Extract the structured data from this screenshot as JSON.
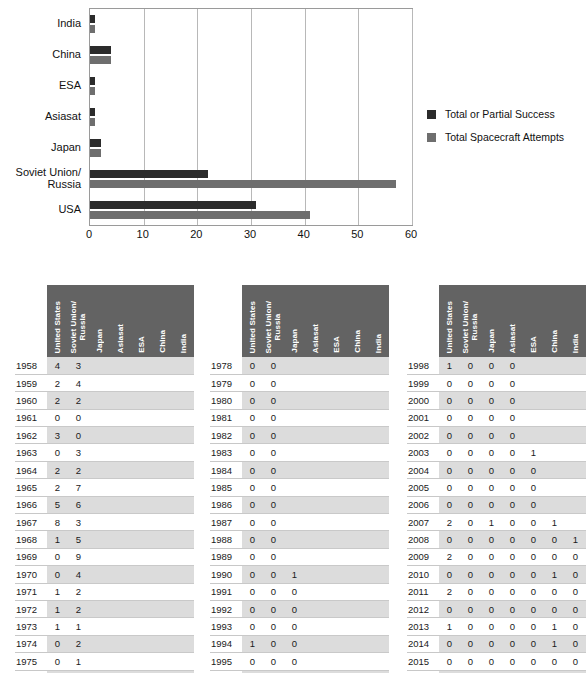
{
  "chart_data": {
    "type": "bar",
    "orientation": "horizontal",
    "title": "",
    "xlabel": "",
    "ylabel": "",
    "xlim": [
      0,
      60
    ],
    "xticks": [
      0,
      10,
      20,
      30,
      40,
      50,
      60
    ],
    "grid": true,
    "legend_position": "right",
    "categories": [
      "India",
      "China",
      "ESA",
      "Asiasat",
      "Japan",
      "Soviet Union/\nRussia",
      "USA"
    ],
    "series": [
      {
        "name": "Total or Partial Success",
        "color": "#2b2b2b",
        "values": [
          1,
          4,
          1,
          1,
          2,
          22,
          31
        ]
      },
      {
        "name": "Total Spacecraft Attempts",
        "color": "#6e6e6e",
        "values": [
          1,
          4,
          1,
          1,
          2,
          57,
          41
        ]
      }
    ]
  },
  "chart": {
    "categories": [
      {
        "label_line1": "India",
        "label_line2": ""
      },
      {
        "label_line1": "China",
        "label_line2": ""
      },
      {
        "label_line1": "ESA",
        "label_line2": ""
      },
      {
        "label_line1": "Asiasat",
        "label_line2": ""
      },
      {
        "label_line1": "Japan",
        "label_line2": ""
      },
      {
        "label_line1": "Soviet Union/",
        "label_line2": "Russia"
      },
      {
        "label_line1": "USA",
        "label_line2": ""
      }
    ],
    "xticks": [
      "0",
      "10",
      "20",
      "30",
      "40",
      "50",
      "60"
    ],
    "legend": [
      {
        "label": "Total or Partial Success",
        "color": "#2b2b2b"
      },
      {
        "label": "Total Spacecraft Attempts",
        "color": "#6e6e6e"
      }
    ]
  },
  "tables": {
    "columns": [
      "United States",
      "Soviet Union/ Russia",
      "Japan",
      "Asiasat",
      "ESA",
      "China",
      "India"
    ],
    "columns_split": [
      [
        "United States"
      ],
      [
        "Soviet Union/",
        "Russia"
      ],
      [
        "Japan"
      ],
      [
        "Asiasat"
      ],
      [
        "ESA"
      ],
      [
        "China"
      ],
      [
        "India"
      ]
    ],
    "blocks": [
      {
        "rows": [
          {
            "year": "1958",
            "values": [
              "4",
              "3",
              "",
              "",
              "",
              "",
              ""
            ]
          },
          {
            "year": "1959",
            "values": [
              "2",
              "4",
              "",
              "",
              "",
              "",
              ""
            ]
          },
          {
            "year": "1960",
            "values": [
              "2",
              "2",
              "",
              "",
              "",
              "",
              ""
            ]
          },
          {
            "year": "1961",
            "values": [
              "0",
              "0",
              "",
              "",
              "",
              "",
              ""
            ]
          },
          {
            "year": "1962",
            "values": [
              "3",
              "0",
              "",
              "",
              "",
              "",
              ""
            ]
          },
          {
            "year": "1963",
            "values": [
              "0",
              "3",
              "",
              "",
              "",
              "",
              ""
            ]
          },
          {
            "year": "1964",
            "values": [
              "2",
              "2",
              "",
              "",
              "",
              "",
              ""
            ]
          },
          {
            "year": "1965",
            "values": [
              "2",
              "7",
              "",
              "",
              "",
              "",
              ""
            ]
          },
          {
            "year": "1966",
            "values": [
              "5",
              "6",
              "",
              "",
              "",
              "",
              ""
            ]
          },
          {
            "year": "1967",
            "values": [
              "8",
              "3",
              "",
              "",
              "",
              "",
              ""
            ]
          },
          {
            "year": "1968",
            "values": [
              "1",
              "5",
              "",
              "",
              "",
              "",
              ""
            ]
          },
          {
            "year": "1969",
            "values": [
              "0",
              "9",
              "",
              "",
              "",
              "",
              ""
            ]
          },
          {
            "year": "1970",
            "values": [
              "0",
              "4",
              "",
              "",
              "",
              "",
              ""
            ]
          },
          {
            "year": "1971",
            "values": [
              "1",
              "2",
              "",
              "",
              "",
              "",
              ""
            ]
          },
          {
            "year": "1972",
            "values": [
              "1",
              "2",
              "",
              "",
              "",
              "",
              ""
            ]
          },
          {
            "year": "1973",
            "values": [
              "1",
              "1",
              "",
              "",
              "",
              "",
              ""
            ]
          },
          {
            "year": "1974",
            "values": [
              "0",
              "2",
              "",
              "",
              "",
              "",
              ""
            ]
          },
          {
            "year": "1975",
            "values": [
              "0",
              "1",
              "",
              "",
              "",
              "",
              ""
            ]
          },
          {
            "year": "1976",
            "values": [
              "0",
              "1",
              "",
              "",
              "",
              "",
              ""
            ]
          }
        ]
      },
      {
        "rows": [
          {
            "year": "1978",
            "values": [
              "0",
              "0",
              "",
              "",
              "",
              "",
              ""
            ]
          },
          {
            "year": "1979",
            "values": [
              "0",
              "0",
              "",
              "",
              "",
              "",
              ""
            ]
          },
          {
            "year": "1980",
            "values": [
              "0",
              "0",
              "",
              "",
              "",
              "",
              ""
            ]
          },
          {
            "year": "1981",
            "values": [
              "0",
              "0",
              "",
              "",
              "",
              "",
              ""
            ]
          },
          {
            "year": "1982",
            "values": [
              "0",
              "0",
              "",
              "",
              "",
              "",
              ""
            ]
          },
          {
            "year": "1983",
            "values": [
              "0",
              "0",
              "",
              "",
              "",
              "",
              ""
            ]
          },
          {
            "year": "1984",
            "values": [
              "0",
              "0",
              "",
              "",
              "",
              "",
              ""
            ]
          },
          {
            "year": "1985",
            "values": [
              "0",
              "0",
              "",
              "",
              "",
              "",
              ""
            ]
          },
          {
            "year": "1986",
            "values": [
              "0",
              "0",
              "",
              "",
              "",
              "",
              ""
            ]
          },
          {
            "year": "1987",
            "values": [
              "0",
              "0",
              "",
              "",
              "",
              "",
              ""
            ]
          },
          {
            "year": "1988",
            "values": [
              "0",
              "0",
              "",
              "",
              "",
              "",
              ""
            ]
          },
          {
            "year": "1989",
            "values": [
              "0",
              "0",
              "",
              "",
              "",
              "",
              ""
            ]
          },
          {
            "year": "1990",
            "values": [
              "0",
              "0",
              "1",
              "",
              "",
              "",
              ""
            ]
          },
          {
            "year": "1991",
            "values": [
              "0",
              "0",
              "0",
              "",
              "",
              "",
              ""
            ]
          },
          {
            "year": "1992",
            "values": [
              "0",
              "0",
              "0",
              "",
              "",
              "",
              ""
            ]
          },
          {
            "year": "1993",
            "values": [
              "0",
              "0",
              "0",
              "",
              "",
              "",
              ""
            ]
          },
          {
            "year": "1994",
            "values": [
              "1",
              "0",
              "0",
              "",
              "",
              "",
              ""
            ]
          },
          {
            "year": "1995",
            "values": [
              "0",
              "0",
              "0",
              "",
              "",
              "",
              ""
            ]
          },
          {
            "year": "1996",
            "values": [
              "0",
              "0",
              "0",
              "",
              "",
              "",
              ""
            ]
          }
        ]
      },
      {
        "rows": [
          {
            "year": "1998",
            "values": [
              "1",
              "0",
              "0",
              "0",
              "",
              "",
              ""
            ]
          },
          {
            "year": "1999",
            "values": [
              "0",
              "0",
              "0",
              "0",
              "",
              "",
              ""
            ]
          },
          {
            "year": "2000",
            "values": [
              "0",
              "0",
              "0",
              "0",
              "",
              "",
              ""
            ]
          },
          {
            "year": "2001",
            "values": [
              "0",
              "0",
              "0",
              "0",
              "",
              "",
              ""
            ]
          },
          {
            "year": "2002",
            "values": [
              "0",
              "0",
              "0",
              "0",
              "",
              "",
              ""
            ]
          },
          {
            "year": "2003",
            "values": [
              "0",
              "0",
              "0",
              "0",
              "1",
              "",
              ""
            ]
          },
          {
            "year": "2004",
            "values": [
              "0",
              "0",
              "0",
              "0",
              "0",
              "",
              ""
            ]
          },
          {
            "year": "2005",
            "values": [
              "0",
              "0",
              "0",
              "0",
              "0",
              "",
              ""
            ]
          },
          {
            "year": "2006",
            "values": [
              "0",
              "0",
              "0",
              "0",
              "0",
              "",
              ""
            ]
          },
          {
            "year": "2007",
            "values": [
              "2",
              "0",
              "1",
              "0",
              "0",
              "1",
              ""
            ]
          },
          {
            "year": "2008",
            "values": [
              "0",
              "0",
              "0",
              "0",
              "0",
              "0",
              "1"
            ]
          },
          {
            "year": "2009",
            "values": [
              "2",
              "0",
              "0",
              "0",
              "0",
              "0",
              "0"
            ]
          },
          {
            "year": "2010",
            "values": [
              "0",
              "0",
              "0",
              "0",
              "0",
              "1",
              "0"
            ]
          },
          {
            "year": "2011",
            "values": [
              "2",
              "0",
              "0",
              "0",
              "0",
              "0",
              "0"
            ]
          },
          {
            "year": "2012",
            "values": [
              "0",
              "0",
              "0",
              "0",
              "0",
              "0",
              "0"
            ]
          },
          {
            "year": "2013",
            "values": [
              "1",
              "0",
              "0",
              "0",
              "0",
              "1",
              "0"
            ]
          },
          {
            "year": "2014",
            "values": [
              "0",
              "0",
              "0",
              "0",
              "0",
              "1",
              "0"
            ]
          },
          {
            "year": "2015",
            "values": [
              "0",
              "0",
              "0",
              "0",
              "0",
              "0",
              "0"
            ]
          },
          {
            "year": "2016",
            "values": [
              "0",
              "0",
              "0",
              "0",
              "0",
              "0",
              "0"
            ]
          }
        ]
      }
    ]
  }
}
